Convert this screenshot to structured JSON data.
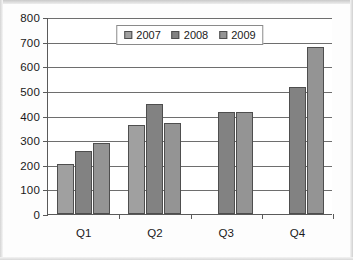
{
  "chart_data": {
    "type": "bar",
    "title": "",
    "xlabel": "",
    "ylabel": "",
    "categories": [
      "Q1",
      "Q2",
      "Q3",
      "Q4"
    ],
    "ylim": [
      0,
      800
    ],
    "ytick_values": [
      0,
      100,
      200,
      300,
      400,
      500,
      600,
      700,
      800
    ],
    "ytick_labels": [
      "0",
      "100",
      "200",
      "300",
      "400",
      "500",
      "600",
      "700",
      "800"
    ],
    "grid": true,
    "legend_position": "top-center",
    "series": [
      {
        "name": "2007",
        "color": "#a0a0a0",
        "values": [
          205,
          363,
          null,
          null
        ]
      },
      {
        "name": "2008",
        "color": "#828282",
        "values": [
          255,
          445,
          415,
          515
        ]
      },
      {
        "name": "2009",
        "color": "#949494",
        "values": [
          288,
          370,
          415,
          680
        ]
      }
    ]
  },
  "legend": {
    "entries": [
      {
        "label": "2007",
        "color": "#a0a0a0"
      },
      {
        "label": "2008",
        "color": "#828282"
      },
      {
        "label": "2009",
        "color": "#949494"
      }
    ]
  },
  "axes": {
    "y_max": 800,
    "y_min": 0
  }
}
